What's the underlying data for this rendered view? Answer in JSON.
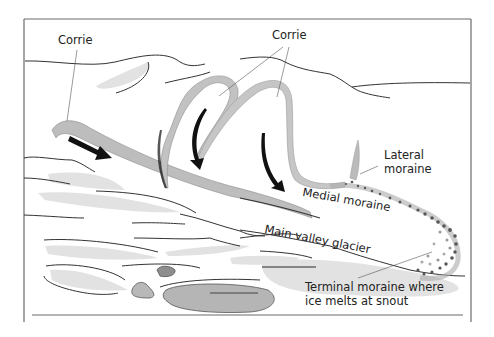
{
  "diagram": {
    "colors": {
      "frame": "#666666",
      "line": "#333333",
      "ice_band": "#b8b8b8",
      "ice_light": "#e4e4e4",
      "arrow": "#111111",
      "rock_dark": "#8a8a8a",
      "rock_light": "#b5b5b5",
      "text": "#222222"
    },
    "labels": {
      "corrie_left": "Corrie",
      "corrie_top": "Corrie",
      "lateral_moraine_line1": "Lateral",
      "lateral_moraine_line2": "moraine",
      "medial_moraine": "Medial moraine",
      "main_valley_glacier": "Main valley glacier",
      "terminal_moraine_line1": "Terminal moraine where",
      "terminal_moraine_line2": "ice melts at snout"
    }
  }
}
